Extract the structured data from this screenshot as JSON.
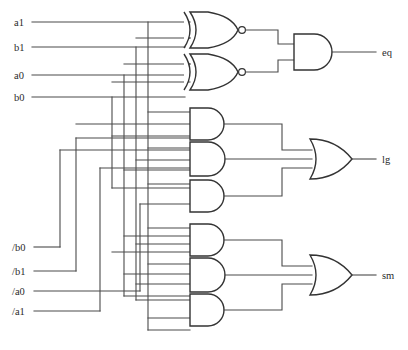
{
  "diagram": {
    "canvas": {
      "width": 408,
      "height": 350
    },
    "colors": {
      "wire": "#4a4a4a",
      "gate_outline": "#333333",
      "background": "#ffffff",
      "text": "#2b2b2b"
    }
  },
  "inputs": [
    {
      "id": "a1",
      "label": "a1",
      "y": 22,
      "x_label": 14,
      "x_start": 32
    },
    {
      "id": "b1",
      "label": "b1",
      "y": 47,
      "x_label": 14,
      "x_start": 32
    },
    {
      "id": "a0",
      "label": "a0",
      "y": 75,
      "x_label": 14,
      "x_start": 32
    },
    {
      "id": "b0",
      "label": "b0",
      "y": 97,
      "x_label": 14,
      "x_start": 32
    },
    {
      "id": "nb0",
      "label": "/b0",
      "y": 247,
      "x_label": 14,
      "x_start": 34
    },
    {
      "id": "nb1",
      "label": "/b1",
      "y": 271,
      "x_label": 14,
      "x_start": 34
    },
    {
      "id": "na0",
      "label": "/a0",
      "y": 291,
      "x_label": 14,
      "x_start": 34
    },
    {
      "id": "na1",
      "label": "/a1",
      "y": 311,
      "x_label": 14,
      "x_start": 34
    }
  ],
  "outputs": [
    {
      "id": "eq",
      "label": "eq",
      "y": 52,
      "x_label": 382
    },
    {
      "id": "lg",
      "label": "lg",
      "y": 159,
      "x_label": 382
    },
    {
      "id": "sm",
      "label": "sm",
      "y": 275,
      "x_label": 382
    }
  ],
  "gates": [
    {
      "id": "xnor1",
      "type": "xnor",
      "label": "XNOR",
      "inputs": 2,
      "cx": 205,
      "cy": 30,
      "w": 42,
      "h": 36
    },
    {
      "id": "xnor2",
      "type": "xnor",
      "label": "XNOR",
      "inputs": 2,
      "cx": 205,
      "cy": 72,
      "w": 42,
      "h": 36
    },
    {
      "id": "and_eq",
      "type": "and",
      "label": "AND",
      "inputs": 2,
      "cx": 313,
      "cy": 52,
      "w": 38,
      "h": 36
    },
    {
      "id": "and_lg1",
      "type": "and",
      "label": "AND",
      "inputs": 3,
      "cx": 208,
      "cy": 124,
      "w": 38,
      "h": 32
    },
    {
      "id": "and_lg2",
      "type": "and",
      "label": "AND",
      "inputs": 4,
      "cx": 208,
      "cy": 159,
      "w": 38,
      "h": 36
    },
    {
      "id": "and_lg3",
      "type": "and",
      "label": "AND",
      "inputs": 3,
      "cx": 208,
      "cy": 192,
      "w": 38,
      "h": 32
    },
    {
      "id": "or_lg",
      "type": "or",
      "label": "OR",
      "inputs": 3,
      "cx": 330,
      "cy": 159,
      "w": 40,
      "h": 40
    },
    {
      "id": "and_sm1",
      "type": "and",
      "label": "AND",
      "inputs": 3,
      "cx": 208,
      "cy": 240,
      "w": 38,
      "h": 32
    },
    {
      "id": "and_sm2",
      "type": "and",
      "label": "AND",
      "inputs": 3,
      "cx": 208,
      "cy": 275,
      "w": 38,
      "h": 36
    },
    {
      "id": "and_sm3",
      "type": "and",
      "label": "AND",
      "inputs": 3,
      "cx": 208,
      "cy": 310,
      "w": 38,
      "h": 32
    },
    {
      "id": "or_sm",
      "type": "or",
      "label": "OR",
      "inputs": 3,
      "cx": 330,
      "cy": 275,
      "w": 40,
      "h": 40
    }
  ],
  "bus_lines": {
    "vertical_x": [
      124,
      136,
      148,
      160,
      112,
      100,
      88,
      76,
      64,
      52
    ]
  }
}
